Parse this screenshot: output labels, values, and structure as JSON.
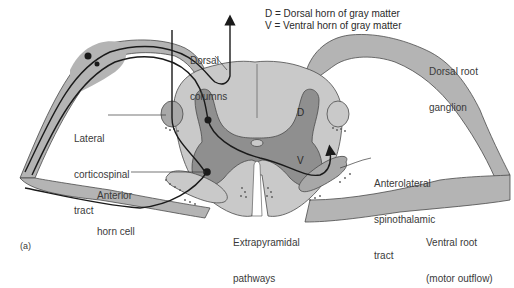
{
  "legend": {
    "line1": "D = Dorsal horn of gray matter",
    "line2": "V = Ventral horn of gray matter"
  },
  "labels": {
    "dorsal_columns": [
      "Dorsal",
      "columns"
    ],
    "dorsal_root_ganglion": [
      "Dorsal root",
      "ganglion"
    ],
    "lateral_corticospinal": [
      "Lateral",
      "corticospinal",
      "tract"
    ],
    "anterior_horn_cell": [
      "Anterior",
      "horn cell"
    ],
    "anterolateral_spinothalamic": [
      "Anterolateral",
      "spinothalamic",
      "tract"
    ],
    "extrapyramidal": [
      "Extrapyramidal",
      "pathways"
    ],
    "ventral_root": [
      "Ventral root",
      "(motor outflow)"
    ],
    "horn_d": "D",
    "horn_v": "V"
  },
  "caption": "(a)",
  "colors": {
    "white_matter": "#c9c9c9",
    "gray_matter": "#8f8f8f",
    "root": "#b4b4b4",
    "outline": "#4a4a4a",
    "nerve": "#1a1a1a"
  }
}
